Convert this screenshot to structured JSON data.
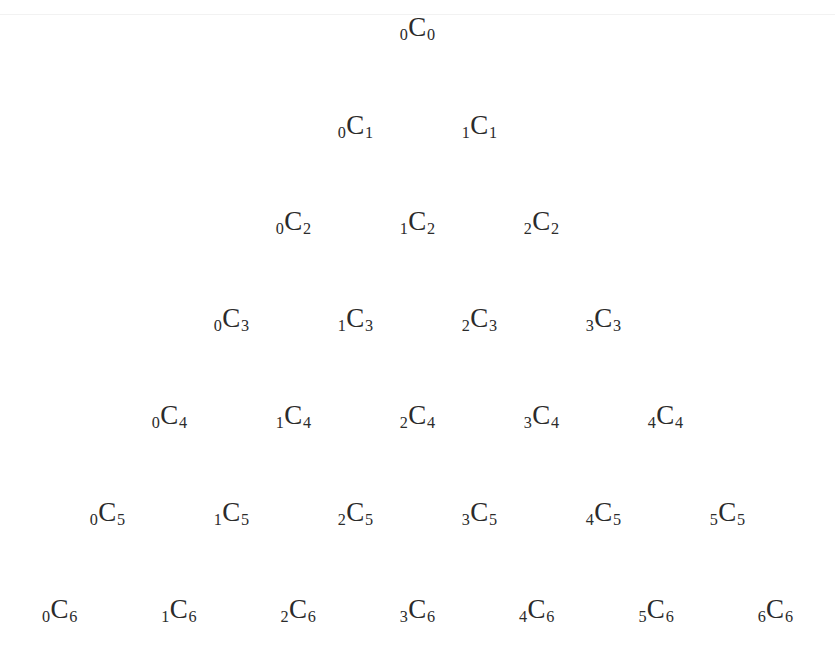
{
  "page": {
    "background_color": "#ffffff",
    "text_color": "#2b2b2b",
    "width": 835,
    "height": 664,
    "artifact_line_color": "#f2f2f2",
    "artifact_line_y": 14
  },
  "notation": {
    "symbol": "C",
    "description": "kCn binomial coefficient notation with left subscript k and right subscript n"
  },
  "chart_data": {
    "type": "table",
    "xlabel": "",
    "ylabel": "",
    "rows": [
      {
        "n": 0,
        "y": 14,
        "entries": [
          {
            "label": "0C0",
            "k": "0",
            "symbol": "C",
            "n": "0"
          }
        ]
      },
      {
        "n": 1,
        "y": 112,
        "entries": [
          {
            "label": "0C1",
            "k": "0",
            "symbol": "C",
            "n": "1"
          },
          {
            "label": "1C1",
            "k": "1",
            "symbol": "C",
            "n": "1"
          }
        ]
      },
      {
        "n": 2,
        "y": 208,
        "entries": [
          {
            "label": "0C2",
            "k": "0",
            "symbol": "C",
            "n": "2"
          },
          {
            "label": "1C2",
            "k": "1",
            "symbol": "C",
            "n": "2"
          },
          {
            "label": "2C2",
            "k": "2",
            "symbol": "C",
            "n": "2"
          }
        ]
      },
      {
        "n": 3,
        "y": 305,
        "entries": [
          {
            "label": "0C3",
            "k": "0",
            "symbol": "C",
            "n": "3"
          },
          {
            "label": "1C3",
            "k": "1",
            "symbol": "C",
            "n": "3"
          },
          {
            "label": "2C3",
            "k": "2",
            "symbol": "C",
            "n": "3"
          },
          {
            "label": "3C3",
            "k": "3",
            "symbol": "C",
            "n": "3"
          }
        ]
      },
      {
        "n": 4,
        "y": 402,
        "entries": [
          {
            "label": "0C4",
            "k": "0",
            "symbol": "C",
            "n": "4"
          },
          {
            "label": "1C4",
            "k": "1",
            "symbol": "C",
            "n": "4"
          },
          {
            "label": "2C4",
            "k": "2",
            "symbol": "C",
            "n": "4"
          },
          {
            "label": "3C4",
            "k": "3",
            "symbol": "C",
            "n": "4"
          },
          {
            "label": "4C4",
            "k": "4",
            "symbol": "C",
            "n": "4"
          }
        ]
      },
      {
        "n": 5,
        "y": 499,
        "entries": [
          {
            "label": "0C5",
            "k": "0",
            "symbol": "C",
            "n": "5"
          },
          {
            "label": "1C5",
            "k": "1",
            "symbol": "C",
            "n": "5"
          },
          {
            "label": "2C5",
            "k": "2",
            "symbol": "C",
            "n": "5"
          },
          {
            "label": "3C5",
            "k": "3",
            "symbol": "C",
            "n": "5"
          },
          {
            "label": "4C5",
            "k": "4",
            "symbol": "C",
            "n": "5"
          },
          {
            "label": "5C5",
            "k": "5",
            "symbol": "C",
            "n": "5"
          }
        ]
      },
      {
        "n": 6,
        "y": 596,
        "entries": [
          {
            "label": "0C6",
            "k": "0",
            "symbol": "C",
            "n": "6"
          },
          {
            "label": "1C6",
            "k": "1",
            "symbol": "C",
            "n": "6"
          },
          {
            "label": "2C6",
            "k": "2",
            "symbol": "C",
            "n": "6"
          },
          {
            "label": "3C6",
            "k": "3",
            "symbol": "C",
            "n": "6"
          },
          {
            "label": "4C6",
            "k": "4",
            "symbol": "C",
            "n": "6"
          },
          {
            "label": "5C6",
            "k": "5",
            "symbol": "C",
            "n": "6"
          },
          {
            "label": "6C6",
            "k": "6",
            "symbol": "C",
            "n": "6"
          }
        ]
      }
    ],
    "layout": {
      "row_spacing": 97,
      "column_spacing": 124,
      "first_row_y": 14,
      "centered": true
    }
  }
}
